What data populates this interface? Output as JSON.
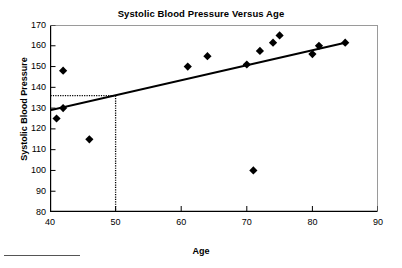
{
  "chart_data": {
    "type": "scatter",
    "title": "Systolic Blood Pressure Versus Age",
    "xlabel": "Age",
    "ylabel": "Systolic Blood Pressure",
    "xlim": [
      40,
      90
    ],
    "ylim": [
      80,
      170
    ],
    "xticks": [
      40,
      50,
      60,
      70,
      80,
      90
    ],
    "yticks": [
      80,
      90,
      100,
      110,
      120,
      130,
      140,
      150,
      160,
      170
    ],
    "grid": false,
    "legend": null,
    "marker": "diamond",
    "marker_color": "#000000",
    "series": [
      {
        "name": "Systolic Blood Pressure",
        "x": [
          41,
          42,
          42,
          46,
          61,
          64,
          70,
          71,
          72,
          74,
          75,
          80,
          81,
          85
        ],
        "y": [
          125,
          130,
          148,
          115,
          150,
          155,
          151,
          100,
          157.5,
          161.5,
          165,
          156,
          160,
          161.5
        ]
      }
    ],
    "trendline": {
      "name": "linear fit",
      "x": [
        40,
        85
      ],
      "y": [
        129,
        161.5
      ],
      "color": "#000000"
    },
    "reference_lines": {
      "x_value": 50,
      "y_value": 136,
      "style": "dotted",
      "color": "#000000"
    },
    "annotations": []
  },
  "axis": {
    "y_tick_labels": [
      "170",
      "160",
      "150",
      "140",
      "130",
      "120",
      "110",
      "100",
      "90",
      "80"
    ],
    "x_tick_labels": [
      "40",
      "50",
      "60",
      "70",
      "80",
      "90"
    ]
  }
}
